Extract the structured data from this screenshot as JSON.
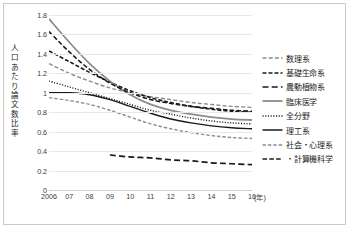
{
  "chart_data": {
    "type": "line",
    "title": "",
    "xlabel": "(年)",
    "ylabel": "人口あたり論文数比率",
    "xlim": [
      2006,
      2016
    ],
    "ylim": [
      0,
      1.8
    ],
    "grid": true,
    "legend_position": "right",
    "x": [
      2006,
      2007,
      2008,
      2009,
      2010,
      2011,
      2012,
      2013,
      2014,
      2015,
      2016
    ],
    "xtick_labels": [
      "2006",
      "07",
      "08",
      "09",
      "10",
      "11",
      "12",
      "13",
      "14",
      "15",
      "16"
    ],
    "ytick_labels": [
      "0",
      "0.2",
      "0.4",
      "0.6",
      "0.8",
      "1",
      "1.2",
      "1.4",
      "1.6",
      "1.8"
    ],
    "ytick_values": [
      0,
      0.2,
      0.4,
      0.6,
      0.8,
      1.0,
      1.2,
      1.4,
      1.6,
      1.8
    ],
    "series": [
      {
        "name": "数理系",
        "style": "dashed-gray",
        "color": "#8c8c8c",
        "values": [
          1.3,
          1.2,
          1.12,
          1.05,
          1.0,
          0.96,
          0.93,
          0.9,
          0.88,
          0.86,
          0.85
        ]
      },
      {
        "name": "基礎生命系",
        "style": "dashed-black",
        "color": "#1a1a1a",
        "values": [
          1.43,
          1.32,
          1.21,
          1.11,
          1.02,
          0.95,
          0.9,
          0.86,
          0.83,
          0.81,
          0.8
        ]
      },
      {
        "name": "農動植物系",
        "style": "longdash-black",
        "color": "#1a1a1a",
        "values": [
          null,
          null,
          null,
          0.36,
          0.34,
          0.33,
          0.31,
          0.3,
          0.28,
          0.27,
          0.26
        ]
      },
      {
        "name": "臨床医学",
        "style": "solid-gray",
        "color": "#8c8c8c",
        "values": [
          1.76,
          1.52,
          1.3,
          1.12,
          0.98,
          0.88,
          0.82,
          0.78,
          0.75,
          0.73,
          0.72
        ]
      },
      {
        "name": "全分野",
        "style": "dotted-black",
        "color": "#1a1a1a",
        "values": [
          1.12,
          1.06,
          1.0,
          0.94,
          0.88,
          0.82,
          0.78,
          0.74,
          0.71,
          0.69,
          0.68
        ]
      },
      {
        "name": "理工系",
        "style": "solid-black",
        "color": "#1a1a1a",
        "values": [
          1.0,
          1.0,
          0.98,
          0.93,
          0.86,
          0.79,
          0.73,
          0.69,
          0.66,
          0.64,
          0.63
        ]
      },
      {
        "name": "社会・心理系",
        "style": "dashed-gray-sm",
        "color": "#8c8c8c",
        "values": [
          0.95,
          0.92,
          0.88,
          0.82,
          0.75,
          0.68,
          0.63,
          0.59,
          0.56,
          0.54,
          0.53
        ]
      },
      {
        "name": "・計算機科学",
        "style": "longdash-black-2",
        "color": "#1a1a1a",
        "values": [
          1.63,
          1.42,
          1.24,
          1.1,
          1.0,
          0.93,
          0.89,
          0.86,
          0.84,
          0.82,
          0.81
        ]
      }
    ]
  },
  "legend": {
    "items": [
      {
        "label": "数理系"
      },
      {
        "label": "基礎生命系"
      },
      {
        "label": "農動植物系"
      },
      {
        "label": "臨床医学"
      },
      {
        "label": "全分野"
      },
      {
        "label": "理工系"
      },
      {
        "label": "社会・心理系"
      },
      {
        "label": "・計算機科学"
      }
    ]
  }
}
